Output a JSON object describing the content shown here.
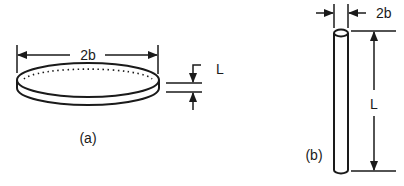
{
  "figure_a": {
    "caption": "(a)",
    "shape": "disk",
    "width_label": "2b",
    "thickness_label": "L"
  },
  "figure_b": {
    "caption": "(b)",
    "shape": "rod",
    "width_label": "2b",
    "length_label": "L"
  },
  "colors": {
    "line": "#1a1a1a",
    "background": "#ffffff"
  }
}
